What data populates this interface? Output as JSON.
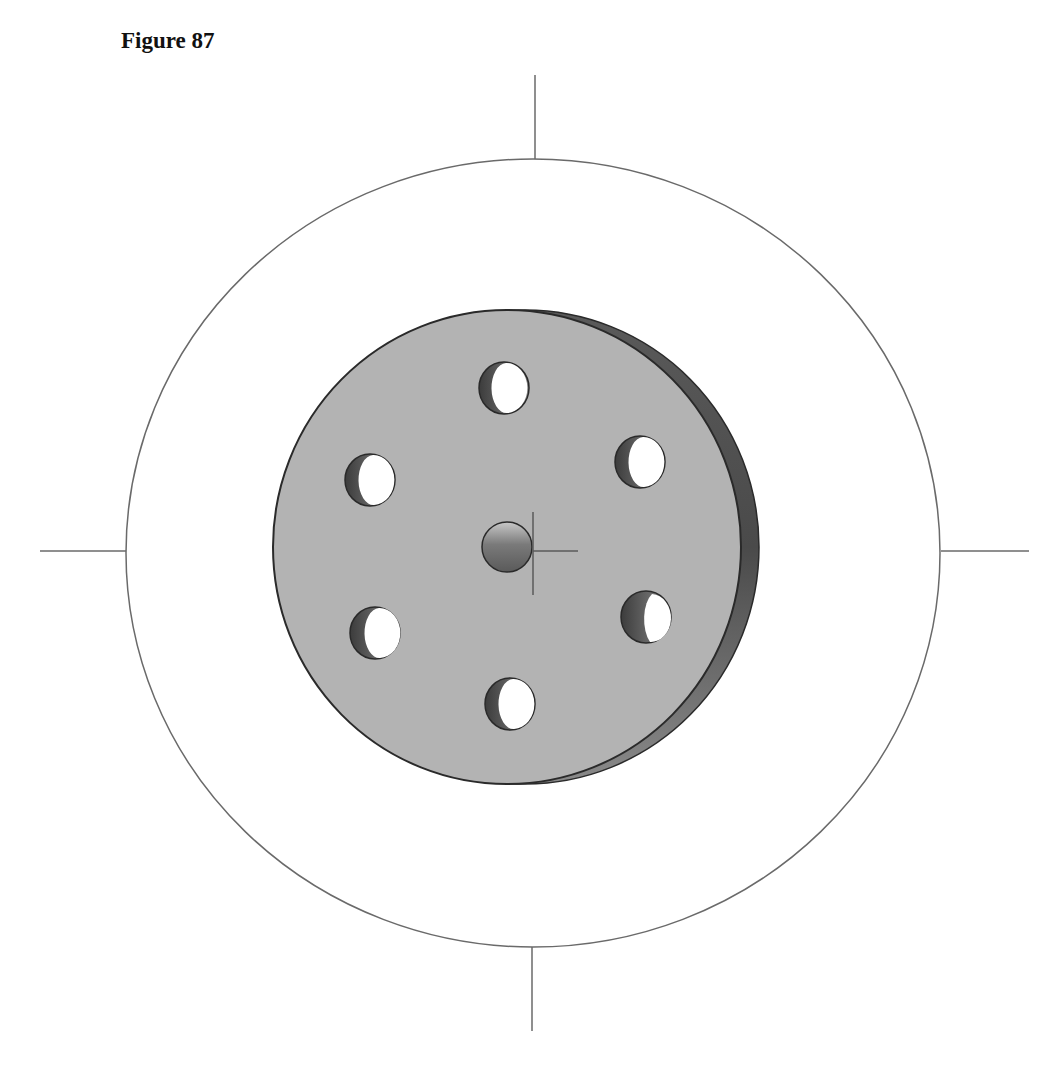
{
  "figure": {
    "title": "Figure 87"
  },
  "colors": {
    "line": "#6a6a6a",
    "face": "#b3b3b3",
    "rim": "#6e6e6e",
    "rim_dark": "#4a4a4a",
    "outline": "#2a2a2a",
    "hole_inner_dark": "#4c4c4c",
    "hole_light": "#ffffff",
    "pin": "#6a6a6a"
  },
  "geometry": {
    "outer_circle": {
      "cx": 533,
      "cy": 553,
      "rx": 407,
      "ry": 394
    },
    "ticks": [
      {
        "x1": 535,
        "y1": 75,
        "x2": 535,
        "y2": 159
      },
      {
        "x1": 532,
        "y1": 947,
        "x2": 532,
        "y2": 1031
      },
      {
        "x1": 40,
        "y1": 551,
        "x2": 126,
        "y2": 551
      },
      {
        "x1": 941,
        "y1": 551,
        "x2": 1029,
        "y2": 551
      }
    ],
    "disk": {
      "cx": 507,
      "cy": 547,
      "rx": 234,
      "ry": 237,
      "rim_offset": 18
    },
    "holes": [
      {
        "name": "top",
        "cx": 504,
        "cy": 388,
        "rx": 25,
        "ry": 26
      },
      {
        "name": "top-right",
        "cx": 640,
        "cy": 462,
        "rx": 25,
        "ry": 26
      },
      {
        "name": "top-left",
        "cx": 370,
        "cy": 480,
        "rx": 25,
        "ry": 26
      },
      {
        "name": "bottom-left",
        "cx": 375,
        "cy": 633,
        "rx": 25,
        "ry": 26
      },
      {
        "name": "bottom-right",
        "cx": 646,
        "cy": 617,
        "rx": 25,
        "ry": 26
      },
      {
        "name": "bottom",
        "cx": 510,
        "cy": 704,
        "rx": 25,
        "ry": 26
      }
    ],
    "center_pin": {
      "cx": 507,
      "cy": 547,
      "r": 25
    },
    "crosshair": {
      "x": 533,
      "y": 551,
      "v_top": 512,
      "v_bottom": 595,
      "h_right": 578
    }
  }
}
